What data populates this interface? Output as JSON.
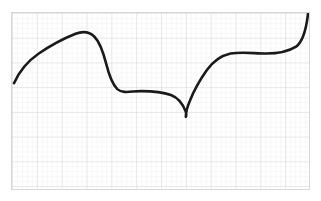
{
  "figure": {
    "background_color": "#ffffff",
    "frame": {
      "x": 11,
      "y": 12,
      "width": 299,
      "height": 178,
      "border_color": "#d8d8d8",
      "border_width": 1
    }
  },
  "grid": {
    "minor_spacing_px": 5,
    "major_every": 5,
    "minor_color": "#e6e6e6",
    "major_color": "#cfcfcf",
    "minor_width": 0.6,
    "major_width": 0.8,
    "visible": true
  },
  "curve": {
    "name": "sketched-curve",
    "color": "#1a1a1a",
    "width": 2.6,
    "linecap": "round",
    "linejoin": "round",
    "style": "hand-drawn",
    "features": [
      "rises from left endpoint",
      "local maximum near x=74",
      "steep descent through inflection near x=112",
      "shallow local minimum plateau near x=150",
      "sharp downward cusp (corner point) at x=186",
      "steep rise to plateau near x=230",
      "final steep rise to top-right endpoint"
    ],
    "endpoints": {
      "left": {
        "x": 13,
        "y": 83
      },
      "right": {
        "x": 309,
        "y": 13
      }
    },
    "path_d": "M 2 71 C 6 62, 14 50, 27 41 C 40 32, 54 25, 64 21 C 72 18, 78 19, 83 24 C 89 30, 92 40, 95 52 C 98 64, 101 72, 106 77 C 112 82, 120 79, 130 79 C 142 79, 152 80, 160 83 C 168 86, 172 92, 175 100 C 176 104, 175 105, 175 105 C 175 102, 176 96, 179 89 C 183 79, 189 68, 196 58 C 203 48, 211 43, 220 41 C 232 39, 244 41, 256 41 C 268 41, 278 39, 286 34 C 293 29, 296 18, 298 1"
  },
  "chart_data": {
    "type": "line",
    "xlabel": "",
    "ylabel": "",
    "grid": true,
    "legend": "none",
    "xlim": [
      0,
      299
    ],
    "ylim": [
      0,
      178
    ],
    "series": [
      {
        "name": "sketched-curve",
        "color": "#1a1a1a",
        "x": [
          2,
          14,
          27,
          40,
          52,
          64,
          74,
          83,
          90,
          95,
          101,
          106,
          113,
          122,
          130,
          140,
          150,
          160,
          168,
          173,
          175,
          177,
          181,
          187,
          193,
          200,
          208,
          216,
          224,
          234,
          246,
          258,
          268,
          277,
          285,
          291,
          295,
          298
        ],
        "y": [
          71,
          50,
          41,
          32,
          25,
          21,
          19,
          24,
          33,
          52,
          69,
          77,
          79,
          79,
          79,
          79,
          80,
          83,
          89,
          98,
          105,
          99,
          86,
          73,
          62,
          53,
          46,
          43,
          41,
          40,
          41,
          41,
          39,
          36,
          31,
          23,
          13,
          1
        ]
      }
    ]
  }
}
